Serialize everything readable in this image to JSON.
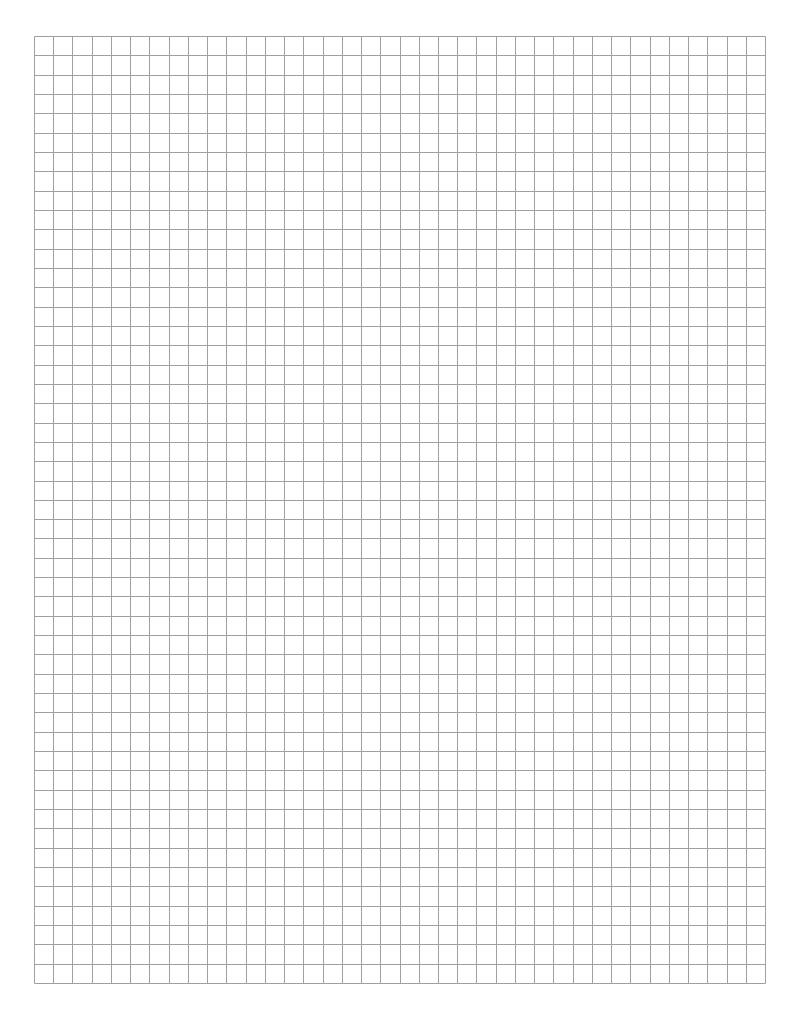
{
  "page": {
    "width": 792,
    "height": 1025,
    "background": "#ffffff"
  },
  "grid": {
    "left": 34,
    "top": 36,
    "right": 765,
    "bottom": 983,
    "columns": 38,
    "rows": 49,
    "line_color": "#a0a0a0",
    "line_width": 1
  }
}
